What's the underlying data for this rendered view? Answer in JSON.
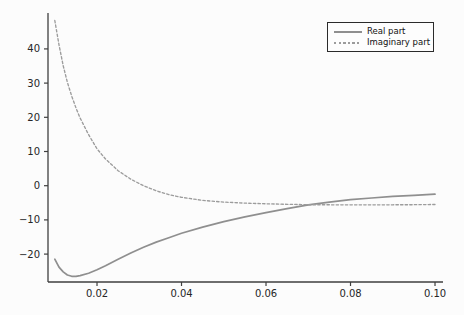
{
  "figure": {
    "background": "#fcfcfc",
    "title": ""
  },
  "chart_data": {
    "type": "line",
    "title": "",
    "xlabel": "",
    "ylabel": "",
    "grid": false,
    "legend_position": "upper right",
    "xlim": [
      0.0084,
      0.10189
    ],
    "ylim": [
      -28.16,
      50.5
    ],
    "x_ticks": [
      0.02,
      0.04,
      0.06,
      0.08,
      0.1
    ],
    "x_tick_labels": [
      "0.02",
      "0.04",
      "0.06",
      "0.08",
      "0.10"
    ],
    "y_ticks": [
      -20,
      -10,
      0,
      10,
      20,
      30,
      40
    ],
    "y_tick_labels": [
      "−20",
      "−10",
      "0",
      "10",
      "20",
      "30",
      "40"
    ],
    "x": [
      0.01,
      0.011,
      0.012,
      0.013,
      0.014,
      0.015,
      0.016,
      0.018,
      0.02,
      0.022,
      0.025,
      0.028,
      0.031,
      0.034,
      0.037,
      0.04,
      0.045,
      0.05,
      0.055,
      0.06,
      0.065,
      0.07,
      0.075,
      0.08,
      0.085,
      0.09,
      0.095,
      0.1
    ],
    "series": [
      {
        "name": "Real part",
        "style": "solid",
        "color": "#8f8f8f",
        "values": [
          -21.5,
          -23.8,
          -25.2,
          -26.1,
          -26.5,
          -26.5,
          -26.3,
          -25.6,
          -24.6,
          -23.4,
          -21.5,
          -19.7,
          -18.0,
          -16.5,
          -15.2,
          -13.9,
          -12.1,
          -10.5,
          -9.1,
          -7.9,
          -6.7,
          -5.6,
          -4.8,
          -4.1,
          -3.6,
          -3.1,
          -2.8,
          -2.5
        ],
        "end_value": -2.5
      },
      {
        "name": "Imaginary part",
        "style": "dashed",
        "color": "#9c9c9c",
        "values": [
          48.3,
          41.2,
          35.1,
          30.2,
          26.2,
          22.8,
          19.8,
          14.9,
          10.8,
          7.8,
          4.4,
          1.9,
          0.0,
          -1.5,
          -2.6,
          -3.4,
          -4.3,
          -4.8,
          -5.1,
          -5.3,
          -5.45,
          -5.55,
          -5.6,
          -5.6,
          -5.6,
          -5.6,
          -5.55,
          -5.5
        ],
        "end_value": -5.5
      }
    ],
    "crossing_point": {
      "x": 0.069,
      "y": -5.7
    }
  },
  "legend": {
    "items": [
      {
        "label": "Real part"
      },
      {
        "label": "Imaginary part"
      }
    ]
  }
}
